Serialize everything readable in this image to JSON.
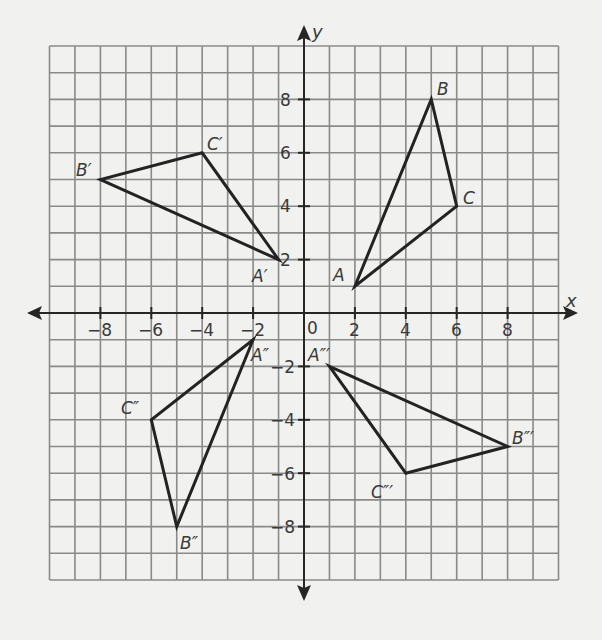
{
  "chart_data": {
    "type": "scatter",
    "title": "",
    "xlabel": "x",
    "ylabel": "y",
    "xlim": [
      -10,
      10
    ],
    "ylim": [
      -10,
      10
    ],
    "grid": true,
    "x_ticks": [
      -8,
      -6,
      -4,
      -2,
      2,
      4,
      6,
      8
    ],
    "y_ticks": [
      8,
      6,
      4,
      2,
      -2,
      -4,
      -6,
      -8
    ],
    "origin_label": "0",
    "series": [
      {
        "name": "ABC",
        "points": [
          {
            "label": "A",
            "x": 2,
            "y": 1
          },
          {
            "label": "B",
            "x": 5,
            "y": 8
          },
          {
            "label": "C",
            "x": 6,
            "y": 4
          }
        ]
      },
      {
        "name": "A'B'C'",
        "points": [
          {
            "label": "A′",
            "x": -1,
            "y": 2
          },
          {
            "label": "B′",
            "x": -8,
            "y": 5
          },
          {
            "label": "C′",
            "x": -4,
            "y": 6
          }
        ]
      },
      {
        "name": "A''B''C''",
        "points": [
          {
            "label": "A″",
            "x": -2,
            "y": -1
          },
          {
            "label": "B″",
            "x": -5,
            "y": -8
          },
          {
            "label": "C″",
            "x": -6,
            "y": -4
          }
        ]
      },
      {
        "name": "A'''B'''C'''",
        "points": [
          {
            "label": "A‴",
            "x": 1,
            "y": -2
          },
          {
            "label": "B‴",
            "x": 8,
            "y": -5
          },
          {
            "label": "C‴",
            "x": 4,
            "y": -6
          }
        ]
      }
    ]
  },
  "axes": {
    "x_label": "x",
    "y_label": "y",
    "origin": "0",
    "x_tick_labels": [
      "−8",
      "−6",
      "−4",
      "−2",
      "2",
      "4",
      "6",
      "8"
    ],
    "y_tick_labels": [
      "8",
      "6",
      "4",
      "2",
      "−2",
      "−4",
      "−6",
      "−8"
    ]
  },
  "labels": {
    "A": "A",
    "B": "B",
    "C": "C",
    "A1": "A′",
    "B1": "B′",
    "C1": "C′",
    "A2": "A″",
    "B2": "B″",
    "C2": "C″",
    "A3": "A″′",
    "B3": "B″′",
    "C3": "C″′"
  }
}
